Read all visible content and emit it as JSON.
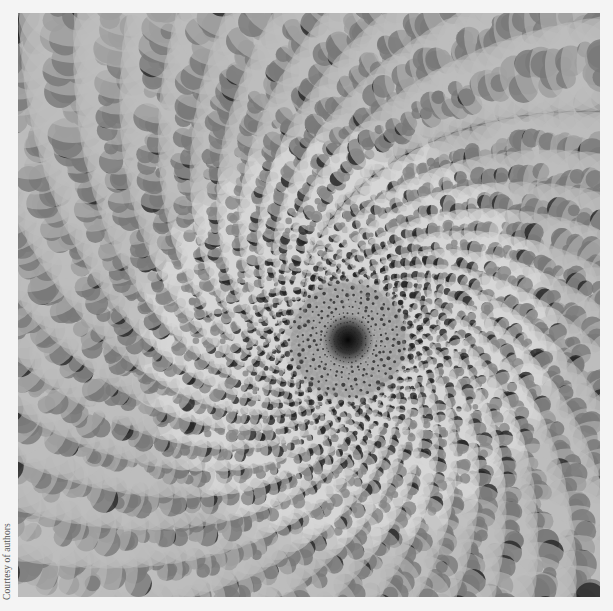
{
  "figure": {
    "center": {
      "x": 348,
      "y": 340
    },
    "arm_count": 36,
    "colors": {
      "outer": "#4e4e4e",
      "mid": "#8a8a8a",
      "inner_ring": "#c8c8c8",
      "core": "#111111",
      "page_background": "#f4f4f4"
    }
  },
  "credit": {
    "text": "Courtesy of authors"
  }
}
